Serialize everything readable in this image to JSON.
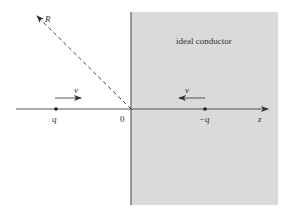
{
  "diagram": {
    "conductor": {
      "label": "ideal conductor",
      "fill_color": "#d9d9d9",
      "border_color": "#444444"
    },
    "axis": {
      "label": "z",
      "origin_label": "0"
    },
    "ray": {
      "label": "R",
      "style": "dashed"
    },
    "charges": [
      {
        "label": "q",
        "velocity_label": "v",
        "velocity_direction": "right"
      },
      {
        "label": "−q",
        "velocity_label": "v",
        "velocity_direction": "left"
      }
    ]
  }
}
